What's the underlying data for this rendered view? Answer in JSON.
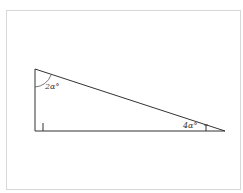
{
  "diagram": {
    "type": "right-triangle",
    "vertices": {
      "top": [
        35,
        69
      ],
      "right_angle": [
        35,
        131
      ],
      "acute_right": [
        225,
        131
      ]
    },
    "angles": [
      {
        "id": "top",
        "label": "2α°"
      },
      {
        "id": "right",
        "label": "4α°"
      },
      {
        "id": "bottom-left",
        "label": "right angle"
      }
    ],
    "colors": {
      "stroke": "#333333",
      "frame": "#d8d8d8"
    }
  }
}
